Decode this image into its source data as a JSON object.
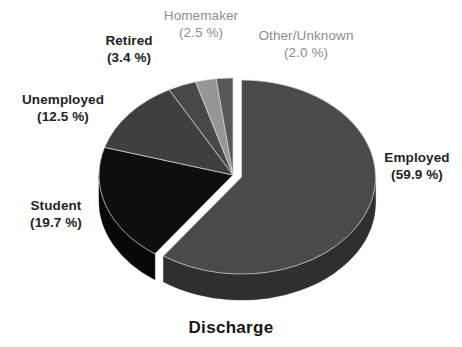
{
  "chart_data": {
    "type": "pie",
    "title": "Discharge",
    "xlabel": "",
    "ylabel": "",
    "units": "%",
    "legend_position": "outside-labels",
    "grid": false,
    "categories": [
      "Employed",
      "Student",
      "Unemployed",
      "Retired",
      "Homemaker",
      "Other/Unknown"
    ],
    "values": [
      59.9,
      19.7,
      12.5,
      3.4,
      2.5,
      2.0
    ],
    "slices": [
      {
        "label": "Employed",
        "value": 59.9,
        "pct_text": "(59.9 %)",
        "color": "#4a4a4a",
        "side_color": "#2f2f2f",
        "exploded": true,
        "label_style": "dark"
      },
      {
        "label": "Student",
        "value": 19.7,
        "pct_text": "(19.7 %)",
        "color": "#0e0e0e",
        "side_color": "#070707",
        "exploded": false,
        "label_style": "dark"
      },
      {
        "label": "Unemployed",
        "value": 12.5,
        "pct_text": "(12.5 %)",
        "color": "#3f3f3f",
        "side_color": "#282828",
        "exploded": false,
        "label_style": "dark"
      },
      {
        "label": "Retired",
        "value": 3.4,
        "pct_text": "(3.4 %)",
        "color": "#484848",
        "side_color": "#2d2d2d",
        "exploded": false,
        "label_style": "dark"
      },
      {
        "label": "Homemaker",
        "value": 2.5,
        "pct_text": "(2.5 %)",
        "color": "#969696",
        "side_color": "#606060",
        "exploded": false,
        "label_style": "light"
      },
      {
        "label": "Other/Unknown",
        "value": 2.0,
        "pct_text": "(2.0 %)",
        "color": "#585858",
        "side_color": "#383838",
        "exploded": false,
        "label_style": "light"
      }
    ]
  },
  "labels": {
    "employed": {
      "name": "Employed",
      "pct": "(59.9 %)"
    },
    "student": {
      "name": "Student",
      "pct": "(19.7 %)"
    },
    "unemployed": {
      "name": "Unemployed",
      "pct": "(12.5 %)"
    },
    "retired": {
      "name": "Retired",
      "pct": "(3.4 %)"
    },
    "homemaker": {
      "name": "Homemaker",
      "pct": "(2.5 %)"
    },
    "other": {
      "name": "Other/Unknown",
      "pct": "(2.0 %)"
    }
  },
  "title": "Discharge"
}
